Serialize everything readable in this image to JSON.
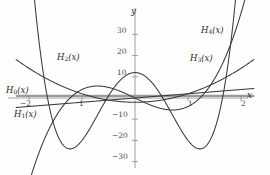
{
  "figure": {
    "background": "#fefefe",
    "curve_color": "#3a3a3a",
    "axis_color": "#8a8a8a",
    "text_color": "#2b2b2b"
  },
  "axes": {
    "x_label": "x",
    "y_label": "y",
    "x_ticks": [
      {
        "value": -2,
        "label": "−2"
      },
      {
        "value": -1,
        "label": "1"
      },
      {
        "value": 1,
        "label": "1"
      },
      {
        "value": 2,
        "label": "2"
      }
    ],
    "y_ticks": [
      {
        "value": 30,
        "label": "30"
      },
      {
        "value": 20,
        "label": "20"
      },
      {
        "value": 10,
        "label": "10"
      },
      {
        "value": -10,
        "label": "−10"
      },
      {
        "value": -20,
        "label": "−20"
      },
      {
        "value": -30,
        "label": "−30"
      }
    ],
    "xlim": [
      -2.25,
      2.25
    ],
    "ylim": [
      -34,
      36
    ],
    "grid": false
  },
  "curve_labels": [
    {
      "name": "H0",
      "base": "H",
      "sub": "0",
      "arg": "(x)"
    },
    {
      "name": "H1",
      "base": "H",
      "sub": "1",
      "arg": "(x)"
    },
    {
      "name": "H2",
      "base": "H",
      "sub": "2",
      "arg": "(x)"
    },
    {
      "name": "H3",
      "base": "H",
      "sub": "3",
      "arg": "(x)"
    },
    {
      "name": "H4",
      "base": "H",
      "sub": "4",
      "arg": "(x)"
    }
  ],
  "chart_data": {
    "type": "line",
    "title": "",
    "xlabel": "x",
    "ylabel": "y",
    "xlim": [
      -2.25,
      2.25
    ],
    "ylim": [
      -34,
      36
    ],
    "grid": false,
    "legend": "inline-curve-labels",
    "series": [
      {
        "name": "H0(x)",
        "expression": "1",
        "coefficients": [
          1
        ],
        "x": [
          -2.25,
          -1.5,
          -1,
          -0.5,
          0,
          0.5,
          1,
          1.5,
          2.25
        ],
        "values": [
          1,
          1,
          1,
          1,
          1,
          1,
          1,
          1,
          1
        ]
      },
      {
        "name": "H1(x)",
        "expression": "2x",
        "coefficients": [
          0,
          2
        ],
        "x": [
          -2.25,
          -1.5,
          -1,
          -0.5,
          0,
          0.5,
          1,
          1.5,
          2.25
        ],
        "values": [
          -4.5,
          -3,
          -2,
          -1,
          0,
          1,
          2,
          3,
          4.5
        ]
      },
      {
        "name": "H2(x)",
        "expression": "4x^2 - 2",
        "coefficients": [
          -2,
          0,
          4
        ],
        "x": [
          -2.25,
          -1.5,
          -1,
          -0.5,
          0,
          0.5,
          1,
          1.5,
          2.25
        ],
        "values": [
          18.25,
          7,
          2,
          -1,
          -2,
          -1,
          2,
          7,
          18.25
        ]
      },
      {
        "name": "H3(x)",
        "expression": "8x^3 - 12x",
        "coefficients": [
          0,
          -12,
          0,
          8
        ],
        "x": [
          -2.25,
          -1.5,
          -1,
          -0.5,
          0,
          0.5,
          1,
          1.5,
          2.25
        ],
        "values": [
          -63.9,
          -9,
          4,
          5,
          0,
          -5,
          -4,
          9,
          63.9
        ]
      },
      {
        "name": "H4(x)",
        "expression": "16x^4 - 48x^2 + 12",
        "coefficients": [
          12,
          0,
          -48,
          0,
          16
        ],
        "x": [
          -2.25,
          -1.5,
          -1.2,
          -1,
          -0.5,
          0,
          0.5,
          1,
          1.2,
          1.5,
          2.25
        ],
        "values": [
          166.9,
          -27,
          -23.5,
          -20,
          -11,
          12,
          -11,
          -20,
          -23.5,
          -27,
          166.9
        ]
      }
    ]
  },
  "label_positions": {
    "H0": {
      "x": 6,
      "y": 85
    },
    "H1": {
      "x": 14,
      "y": 109
    },
    "H2": {
      "x": 57,
      "y": 52
    },
    "H3": {
      "x": 190,
      "y": 53
    },
    "H4": {
      "x": 201,
      "y": 25
    }
  }
}
